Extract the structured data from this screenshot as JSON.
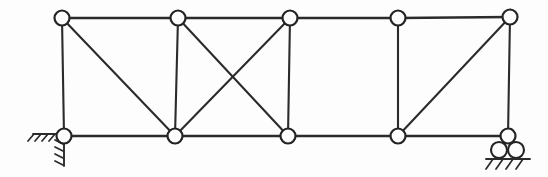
{
  "figure": {
    "type": "truss-diagram",
    "background_color": "#fdfdfd",
    "line_color": "#2b2b2b",
    "node_fill_color": "#fdfdfd"
  },
  "geometry": {
    "width": 548,
    "height": 177,
    "top_chord_y": 18,
    "bottom_chord_y": 136,
    "node_radius": 7.5,
    "panel_count": 4
  },
  "nodes": {
    "top": [
      {
        "id": "T1",
        "x": 62,
        "y": 18,
        "label": "top-left"
      },
      {
        "id": "T2",
        "x": 178,
        "y": 18,
        "label": "top-second"
      },
      {
        "id": "T3",
        "x": 290,
        "y": 18,
        "label": "top-third"
      },
      {
        "id": "T4",
        "x": 398,
        "y": 18,
        "label": "top-fourth"
      },
      {
        "id": "T5",
        "x": 510,
        "y": 17,
        "label": "top-right"
      }
    ],
    "bottom": [
      {
        "id": "B1",
        "x": 64,
        "y": 136,
        "label": "bottom-left-support"
      },
      {
        "id": "B2",
        "x": 175,
        "y": 136,
        "label": "bottom-second"
      },
      {
        "id": "B3",
        "x": 288,
        "y": 136,
        "label": "bottom-third"
      },
      {
        "id": "B4",
        "x": 398,
        "y": 136,
        "label": "bottom-fourth"
      },
      {
        "id": "B5",
        "x": 508,
        "y": 136,
        "label": "bottom-right-support"
      }
    ]
  },
  "members": {
    "top_chord": [
      {
        "from": "T1",
        "to": "T2"
      },
      {
        "from": "T2",
        "to": "T3"
      },
      {
        "from": "T3",
        "to": "T4"
      },
      {
        "from": "T4",
        "to": "T5"
      }
    ],
    "bottom_chord": [
      {
        "from": "B1",
        "to": "B2"
      },
      {
        "from": "B2",
        "to": "B3"
      },
      {
        "from": "B3",
        "to": "B4"
      },
      {
        "from": "B4",
        "to": "B5"
      }
    ],
    "verticals": [
      {
        "from": "T1",
        "to": "B1"
      },
      {
        "from": "T2",
        "to": "B2"
      },
      {
        "from": "T3",
        "to": "B3"
      },
      {
        "from": "T4",
        "to": "B4"
      },
      {
        "from": "T5",
        "to": "B5"
      }
    ],
    "diagonals": [
      {
        "from": "T1",
        "to": "B2",
        "panel": 1,
        "direction": "down-right"
      },
      {
        "from": "T2",
        "to": "B3",
        "panel": 2,
        "direction": "down-right"
      },
      {
        "from": "B2",
        "to": "T3",
        "panel": 2,
        "direction": "up-right"
      },
      {
        "from": "B4",
        "to": "T5",
        "panel": 4,
        "direction": "up-right"
      }
    ],
    "panel_3_bracing": "none"
  },
  "supports": {
    "left": {
      "type": "pin",
      "node": "B1",
      "name": "pin-support",
      "hatch_side_count": 5,
      "hatch_bottom_count": 4
    },
    "right": {
      "type": "roller",
      "node": "B5",
      "name": "roller-support",
      "roller_count": 2,
      "hatch_count": 4
    }
  }
}
